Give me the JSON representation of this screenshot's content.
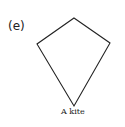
{
  "figure": {
    "label": "(e)",
    "caption": "A kite",
    "shape": "kite",
    "stroke_color": "#222222",
    "vertices": {
      "top": [
        74,
        18
      ],
      "right": [
        110,
        43
      ],
      "bottom": [
        74,
        106
      ],
      "left": [
        37,
        44
      ]
    }
  }
}
